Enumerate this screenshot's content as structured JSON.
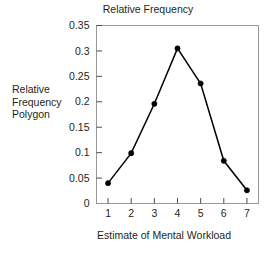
{
  "chart_data": {
    "type": "line",
    "title": "Relative Frequency",
    "subtitle": "",
    "xlabel": "Estimate of Mental Workload",
    "ylabel": "",
    "side_caption": [
      "Relative",
      "Frequency",
      "Polygon"
    ],
    "x": [
      1,
      2,
      3,
      4,
      5,
      6,
      7
    ],
    "categories": [
      "1",
      "2",
      "3",
      "4",
      "5",
      "6",
      "7"
    ],
    "values": [
      0.04,
      0.099,
      0.196,
      0.305,
      0.236,
      0.084,
      0.026
    ],
    "series": [
      {
        "name": "Relative Frequency",
        "values": [
          0.04,
          0.099,
          0.196,
          0.305,
          0.236,
          0.084,
          0.026
        ]
      }
    ],
    "xlim": [
      0.5,
      7.5
    ],
    "ylim": [
      0,
      0.35
    ],
    "xticks": [
      1,
      2,
      3,
      4,
      5,
      6,
      7
    ],
    "xticklabels": [
      "1",
      "2",
      "3",
      "4",
      "5",
      "6",
      "7"
    ],
    "yticks": [
      0,
      0.05,
      0.1,
      0.15,
      0.2,
      0.25,
      0.3,
      0.35
    ],
    "yticklabels": [
      "0",
      "0.05",
      "0.1",
      "0.15",
      "0.2",
      "0.25",
      "0.3",
      "0.35"
    ],
    "grid": false,
    "legend": false,
    "legend_position": "none",
    "marker": "filled-circle",
    "line_color": "#000000",
    "marker_color": "#000000",
    "frame_color": "#9a9a9a",
    "background_color": "#ffffff",
    "text_color": "#231f20"
  }
}
